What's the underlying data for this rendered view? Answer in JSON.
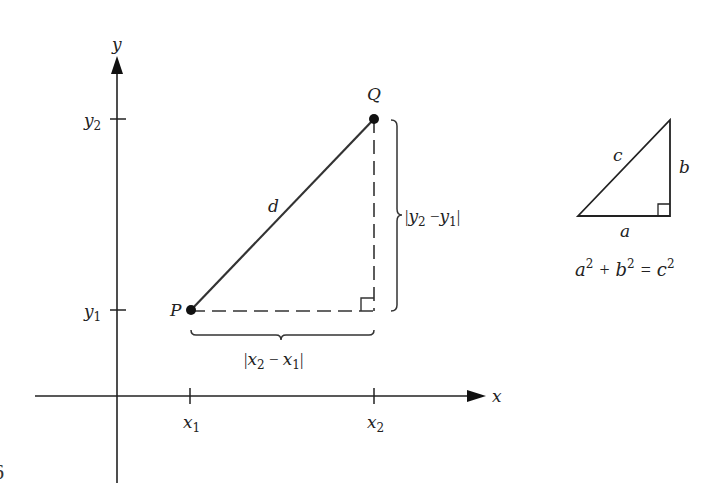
{
  "figure": {
    "axes": {
      "x_label": "x",
      "y_label": "y",
      "x_ticks": [
        {
          "base": "x",
          "sub": "1"
        },
        {
          "base": "x",
          "sub": "2"
        }
      ],
      "y_ticks": [
        {
          "base": "y",
          "sub": "2"
        },
        {
          "base": "y",
          "sub": "1"
        }
      ]
    },
    "points": {
      "P": "P",
      "Q": "Q"
    },
    "segment_label": "d",
    "horizontal_brace_label": {
      "open": "|",
      "a": "x",
      "a_sub": "2",
      "minus": " − ",
      "b": "x",
      "b_sub": "1",
      "close": "|"
    },
    "vertical_brace_label": {
      "open": "|",
      "a": "y",
      "a_sub": "2",
      "minus": " −",
      "b": "y",
      "b_sub": "1",
      "close": "|"
    },
    "inset_triangle": {
      "hyp": "c",
      "leg_vertical": "b",
      "leg_horizontal": "a",
      "formula": {
        "a": "a",
        "b": "b",
        "c": "c",
        "exp": "2",
        "plus": "+",
        "equals": "="
      }
    },
    "edge_fragment": "6"
  }
}
